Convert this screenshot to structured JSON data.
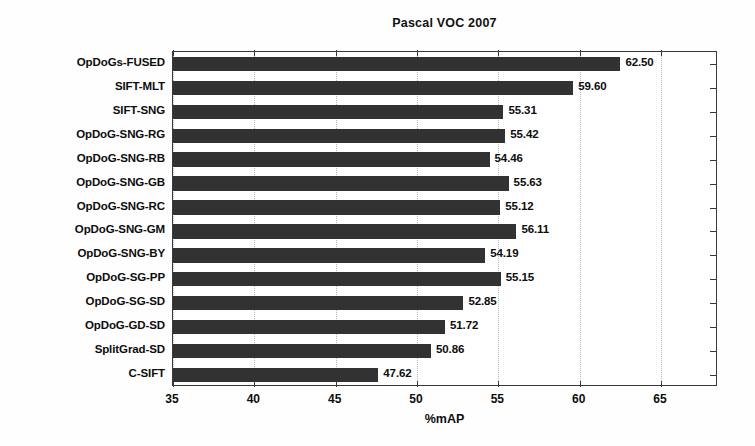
{
  "chart_data": {
    "type": "bar",
    "orientation": "horizontal",
    "title": "Pascal VOC 2007",
    "xlabel": "%mAP",
    "ylabel": "",
    "xlim": [
      35,
      68.5
    ],
    "xticks": [
      35,
      40,
      45,
      50,
      55,
      60,
      65
    ],
    "xtick_labels": [
      "35",
      "40",
      "45",
      "50",
      "55",
      "60",
      "65"
    ],
    "grid": "vertical-dotted",
    "legend": null,
    "bar_color": "#323232",
    "categories": [
      "OpDoGs-FUSED",
      "SIFT-MLT",
      "SIFT-SNG",
      "OpDoG-SNG-RG",
      "OpDoG-SNG-RB",
      "OpDoG-SNG-GB",
      "OpDoG-SNG-RC",
      "OpDoG-SNG-GM",
      "OpDoG-SNG-BY",
      "OpDoG-SG-PP",
      "OpDoG-SG-SD",
      "OpDoG-GD-SD",
      "SplitGrad-SD",
      "C-SIFT"
    ],
    "values": [
      62.5,
      59.6,
      55.31,
      55.42,
      54.46,
      55.63,
      55.12,
      56.11,
      54.19,
      55.15,
      52.85,
      51.72,
      50.86,
      47.62
    ],
    "value_labels": [
      "62.50",
      "59.60",
      "55.31",
      "55.42",
      "54.46",
      "55.63",
      "55.12",
      "56.11",
      "54.19",
      "55.15",
      "52.85",
      "51.72",
      "50.86",
      "47.62"
    ]
  }
}
